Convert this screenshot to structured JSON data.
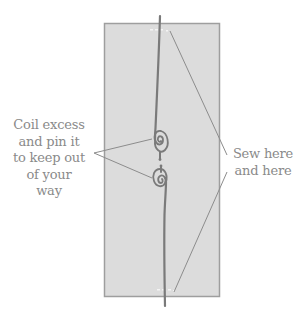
{
  "labels": {
    "left": {
      "lines": [
        "Coil excess",
        "and pin it",
        "to keep out",
        "of your",
        "way"
      ]
    },
    "right": {
      "lines": [
        "Sew here",
        "and here"
      ]
    }
  },
  "colors": {
    "fabric_fill": "#dcdcdc",
    "fabric_border": "#9e9e9e",
    "thread": "#7a7a7a",
    "leader_line": "#8c8c8c",
    "label_text": "#8a8a8a",
    "stitch_marks": "#f4f4f4"
  },
  "panel": {
    "x": 104,
    "y": 23,
    "width": 116,
    "height": 274
  },
  "threads": {
    "top": {
      "start": [
        160,
        16
      ],
      "end": [
        156,
        135
      ]
    },
    "bottom": {
      "start": [
        161,
        184
      ],
      "end": [
        165,
        306
      ]
    }
  },
  "coils": [
    {
      "name": "upper-coil",
      "cx": 160,
      "cy": 140
    },
    {
      "name": "lower-coil",
      "cx": 161,
      "cy": 177
    }
  ],
  "leaders": {
    "left_origin": [
      95,
      152
    ],
    "left_targets": [
      [
        152,
        138
      ],
      [
        152,
        178
      ]
    ],
    "right_top": {
      "from": [
        226,
        155
      ],
      "to": [
        170,
        30
      ]
    },
    "right_bottom": {
      "from": [
        226,
        172
      ],
      "to": [
        175,
        292
      ]
    }
  }
}
